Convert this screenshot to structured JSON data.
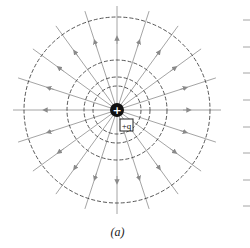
{
  "figure": {
    "caption": "(a)",
    "charge_symbol": "+",
    "charge_label": "+q",
    "center": [
      117,
      110
    ],
    "charge_radius": 7,
    "field_line_count": 20,
    "field_line_length": 104,
    "field_line_color": "#9a9a9a",
    "equipotential_radii": [
      24,
      33,
      50,
      93
    ],
    "equipotential_color": "#444444",
    "right_ticks_y": [
      20,
      47,
      73,
      100,
      127,
      153,
      180,
      206
    ],
    "right_tick_color": "#9a9a9a"
  }
}
